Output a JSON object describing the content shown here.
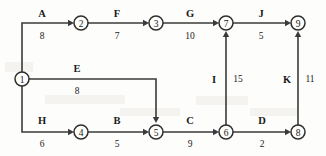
{
  "diagram": {
    "type": "directed-activity-network",
    "nodes": [
      {
        "id": "1",
        "label": "1",
        "x": 22,
        "y": 79,
        "r": 7
      },
      {
        "id": "2",
        "label": "2",
        "x": 81,
        "y": 23,
        "r": 7
      },
      {
        "id": "3",
        "label": "3",
        "x": 156,
        "y": 23,
        "r": 7
      },
      {
        "id": "4",
        "label": "4",
        "x": 81,
        "y": 132,
        "r": 7
      },
      {
        "id": "5",
        "label": "5",
        "x": 156,
        "y": 132,
        "r": 7
      },
      {
        "id": "6",
        "label": "6",
        "x": 226,
        "y": 132,
        "r": 7
      },
      {
        "id": "7",
        "label": "7",
        "x": 226,
        "y": 23,
        "r": 7
      },
      {
        "id": "8",
        "label": "8",
        "x": 298,
        "y": 132,
        "r": 7
      },
      {
        "id": "9",
        "label": "9",
        "x": 298,
        "y": 23,
        "r": 7
      }
    ],
    "edges": [
      {
        "id": "A",
        "name": "A",
        "weight": "8",
        "from": "1",
        "to": "2",
        "path": "M 22 72 L 22 23 L 72 23",
        "arrow": {
          "x": 74,
          "y": 23,
          "dir": "right"
        },
        "name_pos": {
          "x": 42,
          "y": 13
        },
        "weight_pos": {
          "x": 42,
          "y": 36
        }
      },
      {
        "id": "F",
        "name": "F",
        "weight": "7",
        "from": "2",
        "to": "3",
        "path": "M 88 23 L 147 23",
        "arrow": {
          "x": 149,
          "y": 23,
          "dir": "right"
        },
        "name_pos": {
          "x": 117,
          "y": 13
        },
        "weight_pos": {
          "x": 117,
          "y": 36
        }
      },
      {
        "id": "G",
        "name": "G",
        "weight": "10",
        "from": "3",
        "to": "7",
        "path": "M 163 23 L 217 23",
        "arrow": {
          "x": 219,
          "y": 23,
          "dir": "right"
        },
        "name_pos": {
          "x": 190,
          "y": 13
        },
        "weight_pos": {
          "x": 190,
          "y": 36
        }
      },
      {
        "id": "J",
        "name": "J",
        "weight": "5",
        "from": "7",
        "to": "9",
        "path": "M 233 23 L 289 23",
        "arrow": {
          "x": 291,
          "y": 23,
          "dir": "right"
        },
        "name_pos": {
          "x": 261,
          "y": 13
        },
        "weight_pos": {
          "x": 261,
          "y": 36
        }
      },
      {
        "id": "E",
        "name": "E",
        "weight": "8",
        "from": "1",
        "to": "5",
        "path": "M 29 79 L 156 79 L 156 121",
        "arrow": {
          "x": 156,
          "y": 123,
          "dir": "down"
        },
        "name_pos": {
          "x": 77,
          "y": 68
        },
        "weight_pos": {
          "x": 77,
          "y": 91
        }
      },
      {
        "id": "H",
        "name": "H",
        "weight": "6",
        "from": "1",
        "to": "4",
        "path": "M 22 86 L 22 132 L 72 132",
        "arrow": {
          "x": 74,
          "y": 132,
          "dir": "right"
        },
        "name_pos": {
          "x": 42,
          "y": 120
        },
        "weight_pos": {
          "x": 42,
          "y": 144
        }
      },
      {
        "id": "B",
        "name": "B",
        "weight": "5",
        "from": "4",
        "to": "5",
        "path": "M 88 132 L 147 132",
        "arrow": {
          "x": 149,
          "y": 132,
          "dir": "right"
        },
        "name_pos": {
          "x": 117,
          "y": 120
        },
        "weight_pos": {
          "x": 117,
          "y": 144
        }
      },
      {
        "id": "C",
        "name": "C",
        "weight": "9",
        "from": "5",
        "to": "6",
        "path": "M 163 132 L 217 132",
        "arrow": {
          "x": 219,
          "y": 132,
          "dir": "right"
        },
        "name_pos": {
          "x": 190,
          "y": 120
        },
        "weight_pos": {
          "x": 190,
          "y": 144
        }
      },
      {
        "id": "D",
        "name": "D",
        "weight": "2",
        "from": "6",
        "to": "8",
        "path": "M 233 132 L 289 132",
        "arrow": {
          "x": 291,
          "y": 132,
          "dir": "right"
        },
        "name_pos": {
          "x": 262,
          "y": 120
        },
        "weight_pos": {
          "x": 262,
          "y": 144
        }
      },
      {
        "id": "I",
        "name": "I",
        "weight": "15",
        "from": "6",
        "to": "7",
        "path": "M 226 125 L 226 33",
        "arrow": {
          "x": 226,
          "y": 31,
          "dir": "up"
        },
        "name_pos": {
          "x": 214,
          "y": 79
        },
        "weight_pos": {
          "x": 238,
          "y": 79
        }
      },
      {
        "id": "K",
        "name": "K",
        "weight": "11",
        "from": "8",
        "to": "9",
        "path": "M 298 125 L 298 33",
        "arrow": {
          "x": 298,
          "y": 31,
          "dir": "up"
        },
        "name_pos": {
          "x": 287,
          "y": 79
        },
        "weight_pos": {
          "x": 310,
          "y": 79
        }
      }
    ],
    "colors": {
      "background": "#fdfdfb",
      "stroke": "#3a3a3a",
      "text": "#1a1a1a"
    }
  }
}
